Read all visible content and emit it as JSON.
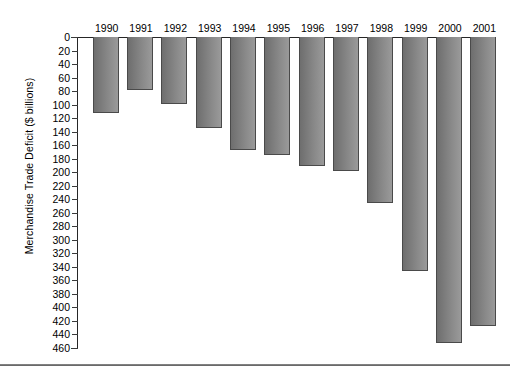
{
  "chart_data": {
    "type": "bar",
    "title": "",
    "subtitle": "",
    "xlabel": "",
    "ylabel": "Merchandise Trade Deficit ($ billions)",
    "categories": [
      "1990",
      "1991",
      "1992",
      "1993",
      "1994",
      "1995",
      "1996",
      "1997",
      "1998",
      "1999",
      "2000",
      "2001"
    ],
    "values": [
      113,
      79,
      99,
      135,
      167,
      174,
      191,
      198,
      246,
      346,
      452,
      427
    ],
    "ylim": [
      0,
      460
    ],
    "y_axis_inverted": true,
    "y_ticks": [
      0,
      20,
      40,
      60,
      80,
      100,
      120,
      140,
      160,
      180,
      200,
      220,
      240,
      260,
      280,
      300,
      320,
      340,
      360,
      380,
      400,
      420,
      440,
      460
    ],
    "y_tick_labels": [
      "0",
      "20",
      "40",
      "60",
      "80",
      "100",
      "120",
      "140",
      "160",
      "180",
      "200",
      "220",
      "240",
      "260",
      "280",
      "300",
      "320",
      "340",
      "360",
      "380",
      "400",
      "420",
      "440",
      "460"
    ],
    "x_tick_position": "top",
    "grid": false,
    "legend": null,
    "bar_color": "#808080",
    "bar_edge_color": "#4a4a4a",
    "axis_color": "#262626",
    "background_color": "#ffffff",
    "annotations": []
  }
}
